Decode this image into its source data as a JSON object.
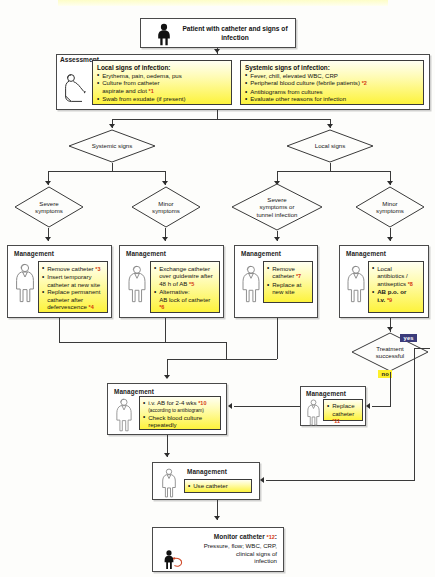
{
  "diagram": {
    "title_banner": "",
    "start": {
      "label": "Patient with catheter\nand signs of infection",
      "icon": "patient-icon"
    },
    "assessment": {
      "label": "Assessment",
      "local": {
        "heading": "Local signs of infection:",
        "items": [
          "Erythema, pain, oedema, pus",
          "Culture from catheter\naspirate and clot",
          "Swab from exudate (if present)"
        ],
        "footnotes": [
          "",
          "*1",
          ""
        ]
      },
      "systemic": {
        "heading": "Systemic signs of infection:",
        "items": [
          "Fever, chill, elevated WBC, CRP",
          "Peripheral blood culture (febrile patients)",
          "Antibiograms from cultures",
          "Evaluate other reasons for infection"
        ],
        "footnotes": [
          "",
          "*2",
          "",
          ""
        ]
      }
    },
    "decisions": {
      "systemic_signs": "Systemic signs",
      "local_signs": "Local signs",
      "severe_symptoms": "Severe\nsymptoms",
      "minor_symptoms_left": "Minor\nsymptoms",
      "severe_or_tunnel": "Severe\nsymptoms or\ntunnel infection",
      "minor_symptoms_right": "Minor\nsymptoms",
      "treatment_successful": "Treatment\nsuccessful"
    },
    "branch_labels": {
      "yes": "yes",
      "no": "no"
    },
    "management_title": "Management",
    "management": {
      "severe_systemic": {
        "title": "Management",
        "items": [
          "Remove catheter",
          "Insert temporary\ncatheter at new site",
          "Replace permanent\ncatheter after\ndefervescence"
        ],
        "footnotes": [
          "*3",
          "",
          "*4"
        ]
      },
      "minor_systemic": {
        "title": "Management",
        "items": [
          "Exchange catheter\nover guidewire after\n48 h of AB",
          "Alternative:\nAB lock of catheter"
        ],
        "footnotes": [
          "*5",
          "*6"
        ]
      },
      "severe_local": {
        "title": "Management",
        "items": [
          "Remove\ncatheter",
          "Replace at\nnew site"
        ],
        "footnotes": [
          "*7",
          ""
        ]
      },
      "minor_local": {
        "title": "Management",
        "items": [
          "Local\nantibiotics /\nantiseptics",
          "AB p.o. or\ni.v."
        ],
        "footnotes": [
          "*8",
          "*9"
        ]
      },
      "iv_ab": {
        "title": "Management",
        "items": [
          "i.v. AB for 2-4 wks",
          "(according  to antibiogram)",
          "Check blood culture\nrepeatedly"
        ],
        "footnotes": [
          "*10",
          "",
          ""
        ]
      },
      "replace_catheter": {
        "title": "Management",
        "items": [
          "Replace\ncatheter"
        ],
        "footnotes": [
          "*11"
        ]
      },
      "use_catheter": {
        "title": "Management",
        "items": [
          "Use catheter"
        ],
        "footnotes": [
          ""
        ]
      }
    },
    "monitor": {
      "title": "Monitor catheter",
      "footnote": "*12",
      "colon": ":",
      "body": "Pressure, flow; WBC, CRP,\nclinical signs of\ninfection"
    },
    "colors": {
      "yellow_fill": "#fdf33c",
      "yes_chip_bg": "#3b3b7a",
      "no_chip_bg": "#fdf02a",
      "footnote_red": "#d4380f",
      "line": "#3a3a3a",
      "box_border": "#4a4a4a"
    }
  }
}
